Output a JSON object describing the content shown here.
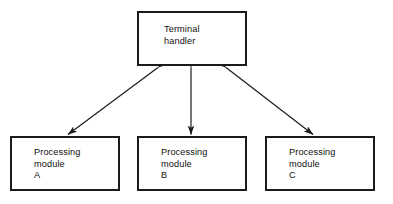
{
  "diagram": {
    "background_color": "#ffffff",
    "line_color": "#1b1b1b",
    "text_color": "#0f0f0f",
    "nodes": [
      {
        "id": "terminal-handler",
        "label": "Terminal\nhandler",
        "line1": "Terminal",
        "line2": "handler",
        "line3": ""
      },
      {
        "id": "module-a",
        "label": "Processing\nmodule\nA",
        "line1": "Processing",
        "line2": "module",
        "line3": "A"
      },
      {
        "id": "module-b",
        "label": "Processing\nmodule\nB",
        "line1": "Processing",
        "line2": "module",
        "line3": "B"
      },
      {
        "id": "module-c",
        "label": "Processing\nmodule\nC",
        "line1": "Processing",
        "line2": "module",
        "line3": "C"
      }
    ],
    "connectors": [
      {
        "id": "link-terminal-module-a",
        "from": "terminal-handler",
        "to": "module-a",
        "style": "double-headed-arrow",
        "orientation": "diagonal-left"
      },
      {
        "id": "link-terminal-module-b",
        "from": "terminal-handler",
        "to": "module-b",
        "style": "double-headed-arrow",
        "orientation": "vertical"
      },
      {
        "id": "link-terminal-module-c",
        "from": "terminal-handler",
        "to": "module-c",
        "style": "double-headed-arrow",
        "orientation": "diagonal-right"
      }
    ]
  }
}
